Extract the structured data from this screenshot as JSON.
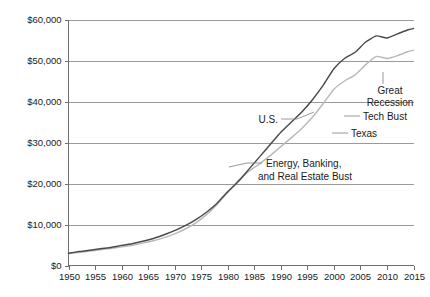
{
  "chart_data": {
    "type": "line",
    "title": "",
    "subtitle": "",
    "xlabel": "",
    "ylabel": "",
    "grid": true,
    "legend_position": "inline-annotations",
    "xlim": [
      1950,
      2015
    ],
    "ylim": [
      0,
      60000
    ],
    "y_tick_labels": [
      "$0",
      "$10,000",
      "$20,000",
      "$30,000",
      "$40,000",
      "$50,000",
      "$60,000"
    ],
    "y_tick_values": [
      0,
      10000,
      20000,
      30000,
      40000,
      50000,
      60000
    ],
    "x_tick_labels": [
      "1950",
      "1955",
      "1960",
      "1965",
      "1970",
      "1975",
      "1980",
      "1985",
      "1990",
      "1995",
      "2000",
      "2005",
      "2010",
      "2015"
    ],
    "x_tick_values": [
      1950,
      1955,
      1960,
      1965,
      1970,
      1975,
      1980,
      1985,
      1990,
      1995,
      2000,
      2005,
      2010,
      2015
    ],
    "x": [
      1950,
      1952,
      1954,
      1956,
      1958,
      1960,
      1962,
      1964,
      1966,
      1968,
      1970,
      1972,
      1974,
      1976,
      1978,
      1980,
      1982,
      1984,
      1986,
      1988,
      1990,
      1992,
      1994,
      1996,
      1998,
      2000,
      2002,
      2004,
      2006,
      2008,
      2010,
      2012,
      2014,
      2015
    ],
    "series": [
      {
        "name": "U.S.",
        "color": "#4a4a4a",
        "values": [
          3000,
          3400,
          3700,
          4100,
          4400,
          4900,
          5300,
          5900,
          6600,
          7500,
          8500,
          9700,
          11200,
          13000,
          15200,
          18000,
          20500,
          23500,
          26500,
          29500,
          32500,
          35000,
          37500,
          40500,
          44000,
          48000,
          50500,
          52000,
          54500,
          56000,
          55500,
          56500,
          57500,
          57800
        ]
      },
      {
        "name": "Texas",
        "color": "#b9b9b9",
        "values": [
          2900,
          3250,
          3500,
          3850,
          4150,
          4550,
          4950,
          5450,
          6050,
          6800,
          7700,
          8900,
          10400,
          12400,
          14900,
          17800,
          20700,
          23000,
          24800,
          26800,
          29000,
          31200,
          33500,
          36200,
          39500,
          43000,
          45000,
          46500,
          49000,
          51000,
          50500,
          51200,
          52200,
          52500
        ]
      }
    ],
    "annotations": [
      {
        "id": "us-label",
        "text": "U.S.",
        "target_year": 1993,
        "target_value": 37000
      },
      {
        "id": "texas-label",
        "text": "Texas",
        "target_year": 1997,
        "target_value": 34500
      },
      {
        "id": "tech-bust-label",
        "text": "Tech Bust",
        "target_year": 2001,
        "target_value": 41000
      },
      {
        "id": "great-recession-label",
        "line1": "Great",
        "line2": "Recession",
        "target_year": 2009,
        "target_value": 50500
      },
      {
        "id": "energy-banking-label",
        "line1": "Energy, Banking,",
        "line2": "and Real Estate Bust",
        "target_year": 1986,
        "target_value": 24200
      }
    ]
  },
  "axis": {
    "y_labels": [
      "$60,000",
      "$50,000",
      "$40,000",
      "$30,000",
      "$20,000",
      "$10,000",
      "$0"
    ],
    "x_labels": [
      "1950",
      "1955",
      "1960",
      "1965",
      "1970",
      "1975",
      "1980",
      "1985",
      "1990",
      "1995",
      "2000",
      "2005",
      "2010",
      "2015"
    ]
  },
  "annotations": {
    "us": "U.S.",
    "texas": "Texas",
    "tech_bust": "Tech Bust",
    "great_recession_line1": "Great",
    "great_recession_line2": "Recession",
    "energy_line1": "Energy, Banking,",
    "energy_line2": "and Real Estate Bust"
  },
  "colors": {
    "us_line": "#4a4a4a",
    "texas_line": "#b9b9b9",
    "gridline": "#9a9a9a",
    "axis": "#6e6e6e",
    "text": "#1a1a1a",
    "background": "#ffffff"
  }
}
